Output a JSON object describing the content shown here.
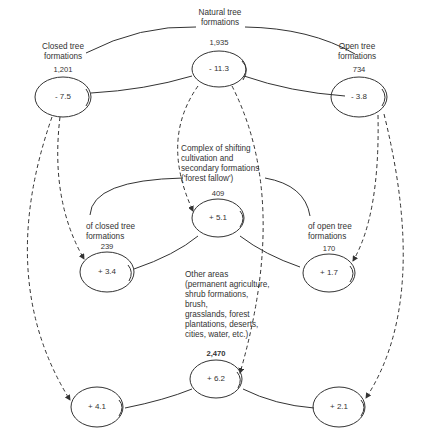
{
  "diagram": {
    "type": "flow-diagram",
    "nodes": [
      {
        "id": "natural",
        "label": [
          "Natural tree",
          "formations"
        ],
        "area": "1,935",
        "change": "- 11.3"
      },
      {
        "id": "closed",
        "label": [
          "Closed tree",
          "formations"
        ],
        "area": "1,201",
        "change": "- 7.5"
      },
      {
        "id": "open",
        "label": [
          "Open tree",
          "formations"
        ],
        "area": "734",
        "change": "- 3.8"
      },
      {
        "id": "fallow",
        "label": [
          "Complex of shifting",
          "cultivation and",
          "secondary formations",
          "('forest fallow')"
        ],
        "area": "409",
        "change": "+ 5.1"
      },
      {
        "id": "fallow_closed",
        "label": [
          "of closed tree",
          "formations"
        ],
        "area": "239",
        "change": "+ 3.4"
      },
      {
        "id": "fallow_open",
        "label": [
          "of open tree",
          "formations"
        ],
        "area": "170",
        "change": "+ 1.7"
      },
      {
        "id": "other",
        "label": [
          "Other areas",
          "(permanent agriculture,",
          "shrub formations,",
          "brush,",
          "grasslands, forest",
          "plantations, deserts,",
          "cities, water, etc.)"
        ],
        "area": "2,470",
        "change": "+ 6.2"
      },
      {
        "id": "other_left",
        "label": [],
        "area": "",
        "change": "+ 4.1"
      },
      {
        "id": "other_right",
        "label": [],
        "area": "",
        "change": "+ 2.1"
      }
    ],
    "edges_solid": [
      [
        "natural",
        "closed"
      ],
      [
        "natural",
        "open"
      ],
      [
        "fallow",
        "fallow_closed"
      ],
      [
        "fallow",
        "fallow_open"
      ],
      [
        "other",
        "other_left"
      ],
      [
        "other",
        "other_right"
      ]
    ],
    "edges_dashed_arrows": [
      [
        "closed",
        "fallow_closed"
      ],
      [
        "closed",
        "other_left"
      ],
      [
        "natural",
        "fallow"
      ],
      [
        "natural",
        "other"
      ],
      [
        "open",
        "fallow_open"
      ],
      [
        "open",
        "other_right"
      ]
    ]
  }
}
